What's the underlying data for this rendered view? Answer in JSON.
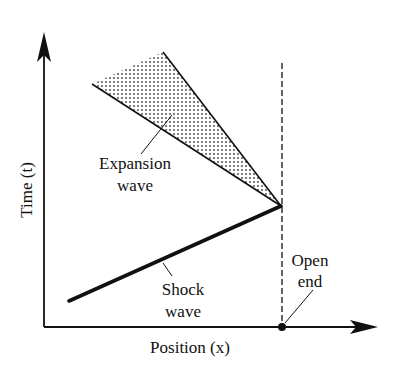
{
  "diagram": {
    "type": "x-t wave diagram",
    "axes": {
      "x_label": "Position (x)",
      "y_label": "Time (t)"
    },
    "labels": {
      "expansion_line1": "Expansion",
      "expansion_line2": "wave",
      "shock_line1": "Shock",
      "shock_line2": "wave",
      "open_line1": "Open",
      "open_line2": "end"
    },
    "elements": [
      {
        "name": "expansion-fan",
        "description": "shaded dotted wedge between two lines meeting at the open end"
      },
      {
        "name": "shock-wave",
        "description": "thick line rising toward the open end"
      },
      {
        "name": "open-end-line",
        "description": "vertical dashed line at the open end position"
      },
      {
        "name": "open-end-point",
        "description": "dot on the position axis"
      }
    ],
    "colors": {
      "ink": "#111111",
      "fill_dots": "#444444",
      "background": "#ffffff"
    }
  }
}
